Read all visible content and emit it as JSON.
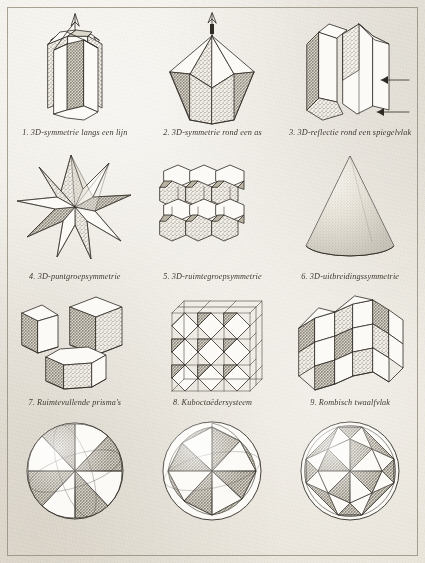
{
  "plate": {
    "title_visible": false,
    "language": "nl",
    "ink_color": "#2e2a24",
    "paper_color": "#efece5"
  },
  "figures": [
    {
      "number": "1.",
      "caption": "1. 3D-symmetrie langs een lijn",
      "icon": "prism-line-symmetry-icon"
    },
    {
      "number": "2.",
      "caption": "2. 3D-symmetrie rond een as",
      "icon": "bipyramid-axis-symmetry-icon"
    },
    {
      "number": "3.",
      "caption": "3. 3D-reflectie rond een spiegelvlak",
      "icon": "crystal-mirror-reflection-icon"
    },
    {
      "number": "4.",
      "caption": "4. 3D-puntgroepsymmetrie",
      "icon": "stellated-polyhedron-icon"
    },
    {
      "number": "5.",
      "caption": "5. 3D-ruimtegroepsymmetrie",
      "icon": "truncated-octahedra-lattice-icon"
    },
    {
      "number": "6.",
      "caption": "6. 3D-uitbreidingssymmetrie",
      "icon": "cone-icon"
    },
    {
      "number": "7.",
      "caption": "7. Ruimtevullende prisma's",
      "icon": "space-filling-prisms-icon"
    },
    {
      "number": "8.",
      "caption": "8. Kuboctaëdersysteem",
      "icon": "cuboctahedron-lattice-icon"
    },
    {
      "number": "9.",
      "caption": "9. Rombisch twaalfvlak",
      "icon": "rhombic-dodecahedra-icon"
    }
  ],
  "spheres": [
    {
      "name": "sphere-tetrahedral-pattern",
      "segments": 8,
      "caption": ""
    },
    {
      "name": "sphere-octahedral-pinwheel-pattern",
      "segments": 16,
      "caption": ""
    },
    {
      "name": "sphere-icosahedral-pinwheel-pattern",
      "segments": 24,
      "caption": ""
    }
  ]
}
